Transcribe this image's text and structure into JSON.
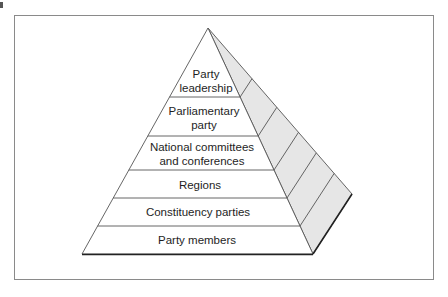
{
  "diagram": {
    "type": "pyramid",
    "title": "",
    "colors": {
      "frame": "#8a8a8a",
      "front_face": "#ffffff",
      "side_face": "#e6e6e6",
      "stroke": "#555555",
      "text": "#1e1e1e"
    },
    "levels": [
      {
        "label_line1": "Party",
        "label_line2": "leadership"
      },
      {
        "label_line1": "Parliamentary",
        "label_line2": "party"
      },
      {
        "label_line1": "National committees",
        "label_line2": "and conferences"
      },
      {
        "label_line1": "Regions",
        "label_line2": ""
      },
      {
        "label_line1": "Constituency parties",
        "label_line2": ""
      },
      {
        "label_line1": "Party members",
        "label_line2": ""
      }
    ]
  }
}
